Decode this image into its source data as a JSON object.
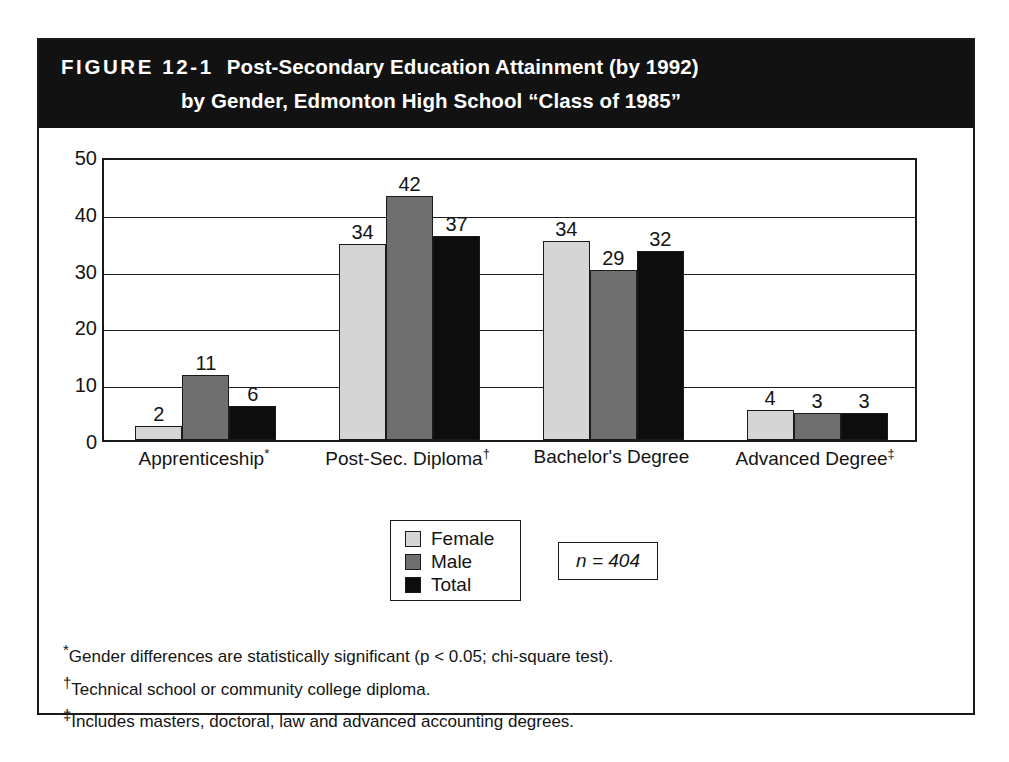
{
  "figure": {
    "number": "FIGURE 12-1",
    "title_line_1": "Post-Secondary Education Attainment (by 1992)",
    "title_line_2": "by Gender, Edmonton High School “Class of 1985”"
  },
  "sample_size_note": "n = 404",
  "legend": {
    "items": [
      {
        "label": "Female",
        "color": "#d5d5d5",
        "key": "female"
      },
      {
        "label": "Male",
        "color": "#6f6f6f",
        "key": "male"
      },
      {
        "label": "Total",
        "color": "#0d0d0d",
        "key": "total"
      }
    ]
  },
  "footnotes": [
    {
      "marker": "*",
      "text": "Gender differences are statistically significant (p < 0.05; chi-square test)."
    },
    {
      "marker": "†",
      "text": "Technical school or community college diploma."
    },
    {
      "marker": "‡",
      "text": "Includes masters, doctoral, law and advanced accounting degrees."
    }
  ],
  "chart_data": {
    "type": "bar",
    "title": "Post-Secondary Education Attainment (by 1992) by Gender, Edmonton High School “Class of 1985”",
    "xlabel": "",
    "ylabel": "",
    "ylim": [
      0,
      50
    ],
    "ytick_labels": [
      "0",
      "10",
      "20",
      "30",
      "40",
      "50"
    ],
    "yticks": [
      0,
      10,
      20,
      30,
      40,
      50
    ],
    "grid": true,
    "legend_position": "bottom-center",
    "categories": [
      "Apprenticeship*",
      "Post-Sec. Diploma†",
      "Bachelor's Degree",
      "Advanced Degree‡"
    ],
    "category_labels": [
      {
        "text": "Apprenticeship",
        "marker": "*"
      },
      {
        "text": "Post-Sec. Diploma",
        "marker": "†"
      },
      {
        "text": "Bachelor's Degree",
        "marker": ""
      },
      {
        "text": "Advanced Degree",
        "marker": "‡"
      }
    ],
    "series": [
      {
        "name": "Female",
        "color": "#d5d5d5",
        "values": [
          2,
          34,
          34,
          4
        ],
        "drawn": [
          2.5,
          34.5,
          35,
          5.2
        ]
      },
      {
        "name": "Male",
        "color": "#6f6f6f",
        "values": [
          11,
          42,
          29,
          3
        ],
        "drawn": [
          11.5,
          43,
          30,
          4.8
        ]
      },
      {
        "name": "Total",
        "color": "#0d0d0d",
        "values": [
          6,
          37,
          32,
          3
        ],
        "drawn": [
          6,
          36,
          33.2,
          4.8
        ]
      }
    ]
  }
}
